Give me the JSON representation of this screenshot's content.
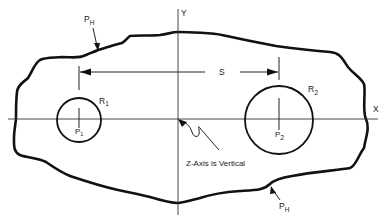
{
  "figure": {
    "type": "schematic",
    "axes": {
      "x_label": "X",
      "y_label": "Y",
      "z_note": "Z-Axis is Vertical"
    },
    "boundary": {
      "label_main": "P",
      "label_sub": "H",
      "label_count": 2
    },
    "pipes": [
      {
        "id": "pipe-1",
        "radius_main": "R",
        "radius_sub": "1",
        "point_main": "P",
        "point_sub": "1"
      },
      {
        "id": "pipe-2",
        "radius_main": "R",
        "radius_sub": "2",
        "point_main": "P",
        "point_sub": "2"
      }
    ],
    "spacing": {
      "label": "S"
    }
  },
  "colors": {
    "ink": "#111111",
    "background": "#ffffff"
  }
}
